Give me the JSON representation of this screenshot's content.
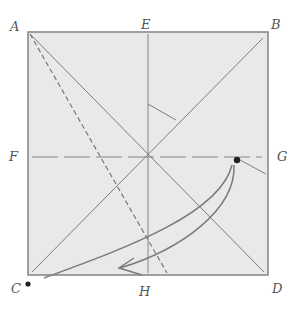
{
  "diagram": {
    "type": "origami-fold-diagram",
    "labels": {
      "A": "A",
      "B": "B",
      "C": "C",
      "D": "D",
      "E": "E",
      "F": "F",
      "G": "G",
      "H": "H"
    },
    "colors": {
      "paper": "#e9e9e9",
      "outline": "#8a8a8a",
      "crease": "#6f6f6f",
      "arrow": "#7a7a7a",
      "dot": "#222222",
      "label": "#555555"
    },
    "points": {
      "A": "top-left corner",
      "B": "top-right corner",
      "C": "bottom-left corner",
      "D": "bottom-right corner",
      "E": "top edge midpoint",
      "F": "left edge midpoint",
      "G": "right edge midpoint",
      "H": "bottom edge midpoint"
    },
    "markers": [
      "dot at G",
      "dot at C"
    ],
    "lines": [
      "diagonal A-D (solid)",
      "diagonal B-C (solid)",
      "vertical E-H crease",
      "horizontal F-G crease (dashed)",
      "dashed valley fold from A toward H",
      "curved fold arrow from G to C"
    ]
  }
}
